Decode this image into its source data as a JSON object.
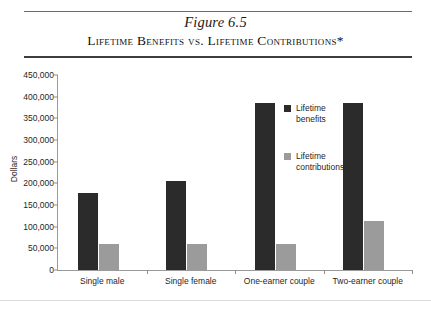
{
  "figure": {
    "number_label": "Figure 6.5",
    "title": "Lifetime Benefits vs. Lifetime Contributions*"
  },
  "legend": {
    "position": "inside-top-right",
    "entries": [
      {
        "label": "Lifetime benefits",
        "color": "#2b2b2b",
        "swatch_name": "legend-swatch-benefits"
      },
      {
        "label": "Lifetime contributions",
        "color": "#9b9b9b",
        "swatch_name": "legend-swatch-contributions"
      }
    ]
  },
  "chart_data": {
    "type": "bar",
    "title": "Lifetime Benefits vs. Lifetime Contributions*",
    "subtitle": "Figure 6.5",
    "xlabel": "",
    "ylabel": "Dollars",
    "ylim": [
      0,
      450000
    ],
    "ytick_step": 50000,
    "ytick_labels": [
      "450,000",
      "400,000",
      "350,000",
      "300,000",
      "250,000",
      "200,000",
      "150,000",
      "100,000",
      "50,000",
      "0"
    ],
    "ytick_values": [
      450000,
      400000,
      350000,
      300000,
      250000,
      200000,
      150000,
      100000,
      50000,
      0
    ],
    "grid": false,
    "legend_position": "inside top right",
    "categories": [
      "Single male",
      "Single female",
      "One-earner couple",
      "Two-earner couple"
    ],
    "series": [
      {
        "name": "Lifetime benefits",
        "color": "#2b2b2b",
        "values": [
          178000,
          205000,
          385000,
          385000
        ]
      },
      {
        "name": "Lifetime contributions",
        "color": "#9b9b9b",
        "values": [
          60000,
          60000,
          60000,
          113000
        ]
      }
    ]
  }
}
